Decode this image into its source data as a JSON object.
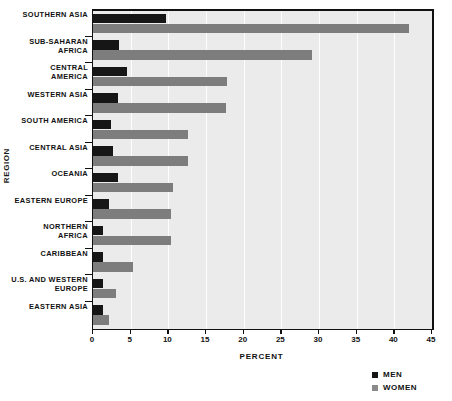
{
  "chart_data": {
    "type": "bar",
    "orientation": "horizontal",
    "title": "",
    "xlabel": "Percent",
    "ylabel": "Region",
    "xlim": [
      0,
      45
    ],
    "xticks": [
      0,
      5,
      10,
      15,
      20,
      25,
      30,
      35,
      40,
      45
    ],
    "xtick_labels": [
      "0",
      "5",
      "10",
      "15",
      "20",
      "25",
      "30",
      "35",
      "40",
      "45"
    ],
    "grid": "vertical",
    "legend_position": "bottom-right",
    "categories": [
      "Southern Asia",
      "Sub-Saharan Africa",
      "Central America",
      "Western Asia",
      "South America",
      "Central Asia",
      "Oceania",
      "Eastern Europe",
      "Northern Africa",
      "Caribbean",
      "U.S. and Western Europe",
      "Eastern Asia"
    ],
    "series": [
      {
        "name": "Men",
        "color": "#161616",
        "values": [
          9.7,
          3.5,
          4.5,
          3.3,
          2.4,
          2.7,
          3.3,
          2.1,
          1.3,
          1.3,
          1.3,
          1.3
        ]
      },
      {
        "name": "Women",
        "color": "#7d7d7d",
        "values": [
          42.0,
          29.1,
          17.8,
          17.7,
          12.6,
          12.6,
          10.6,
          10.4,
          10.4,
          5.3,
          3.0,
          2.1
        ]
      }
    ]
  },
  "legend": {
    "items": [
      {
        "label": "Men",
        "color": "#161616"
      },
      {
        "label": "Women",
        "color": "#8a8a8a"
      }
    ]
  },
  "axes": {
    "x_title": "Percent",
    "y_title": "Region"
  },
  "colors": {
    "plot_background": "#ebebeb",
    "gridline": "#ffffff",
    "frame": "#111111",
    "men_bar": "#161616",
    "women_bar": "#7d7d7d"
  }
}
